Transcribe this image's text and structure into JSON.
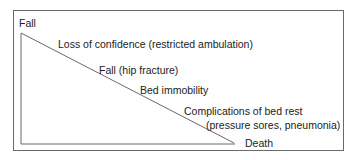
{
  "diagram": {
    "start_label": "Fall",
    "steps": [
      "Loss of confidence (restricted ambulation)",
      "Fall (hip fracture)",
      "Bed immobility",
      "Complications of bed rest",
      "(pressure sores, pneumonia)"
    ],
    "end_label": "Death",
    "colors": {
      "line": "#6a6a6a",
      "text": "#222222"
    }
  }
}
